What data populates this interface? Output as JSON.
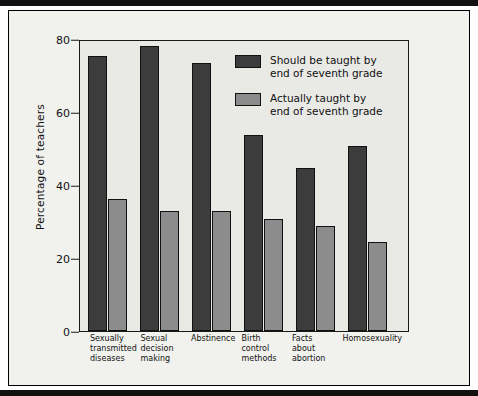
{
  "chart_data": {
    "type": "bar",
    "title": "",
    "xlabel": "",
    "ylabel": "Percentage of teachers",
    "ylim": [
      0,
      80
    ],
    "yticks": [
      0,
      20,
      40,
      60,
      80
    ],
    "grid": false,
    "legend_position": "top-center-inside",
    "categories": [
      "Sexually transmitted diseases",
      "Sexual decision making",
      "Abstinence",
      "Birth control methods",
      "Facts about abortion",
      "Homosexuality"
    ],
    "category_lines": [
      [
        "Sexually",
        "transmitted",
        "diseases"
      ],
      [
        "Sexual",
        "decision",
        "making"
      ],
      [
        "Abstinence"
      ],
      [
        "Birth",
        "control",
        "methods"
      ],
      [
        "Facts",
        "about",
        "abortion"
      ],
      [
        "Homosexuality"
      ]
    ],
    "series": [
      {
        "name": "Should be taught by end of seventh grade",
        "name_lines": [
          "Should be taught by",
          "end of seventh grade"
        ],
        "color": "#3c3c3c",
        "values": [
          76,
          78.5,
          74,
          54,
          45,
          51
        ]
      },
      {
        "name": "Actually taught by end of seventh grade",
        "name_lines": [
          "Actually taught by",
          "end of seventh grade"
        ],
        "color": "#8c8c8c",
        "values": [
          36.5,
          33,
          33,
          31,
          29,
          24.5
        ]
      }
    ]
  },
  "axis": {
    "y_title": "Percentage of teachers",
    "tick_labels": [
      "80",
      "60",
      "40",
      "20",
      "0"
    ]
  },
  "legend": {
    "entries": [
      {
        "line1": "Should be taught by",
        "line2": "end of seventh grade",
        "swatch": "dark-swatch"
      },
      {
        "line1": "Actually taught by",
        "line2": "end of seventh grade",
        "swatch": "light-swatch"
      }
    ]
  },
  "colors": {
    "should_bar": "#3c3c3c",
    "actually_bar": "#8c8c8c",
    "plot_background": "#e9e9e6",
    "figure_background": "#f1f1ee",
    "axis_line": "#1a1a1a"
  }
}
